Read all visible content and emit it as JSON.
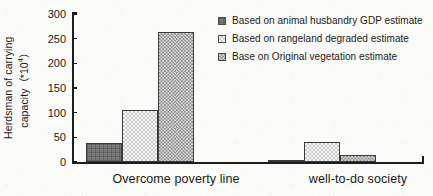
{
  "chart_data": {
    "type": "bar",
    "title": "",
    "xlabel": "",
    "ylabel_line1": "Herdsman of carrying",
    "ylabel_line2": "capacity（*10",
    "ylabel_exponent": "4",
    "ylabel_tail": "）",
    "ylabel_full": "Herdsman of carrying capacity（*10⁴）",
    "categories": [
      "Overcome poverty line",
      "well-to-do society"
    ],
    "series": [
      {
        "name": "Based on animal husbandry GDP estimate",
        "values": [
          38,
          4
        ],
        "pattern": "dark-solid-grid",
        "color": "#7a7a7a"
      },
      {
        "name": "Based on rangeland degraded estimate",
        "values": [
          105,
          40
        ],
        "pattern": "light-checkerboard",
        "color": "#e6e6e6"
      },
      {
        "name": "Base on Original vegetation estimate",
        "values": [
          263,
          14
        ],
        "pattern": "medium-checkerboard",
        "color": "#bdbdbd"
      }
    ],
    "ylim": [
      0,
      300
    ],
    "yticks": [
      0,
      50,
      100,
      150,
      200,
      250,
      300
    ],
    "ytick_labels": [
      "0",
      "50",
      "100",
      "150",
      "200",
      "250",
      "300"
    ],
    "grid": false,
    "legend_position": "top-right",
    "axis_color": "#1d1d1d",
    "background_color": "#fbfbf9"
  }
}
